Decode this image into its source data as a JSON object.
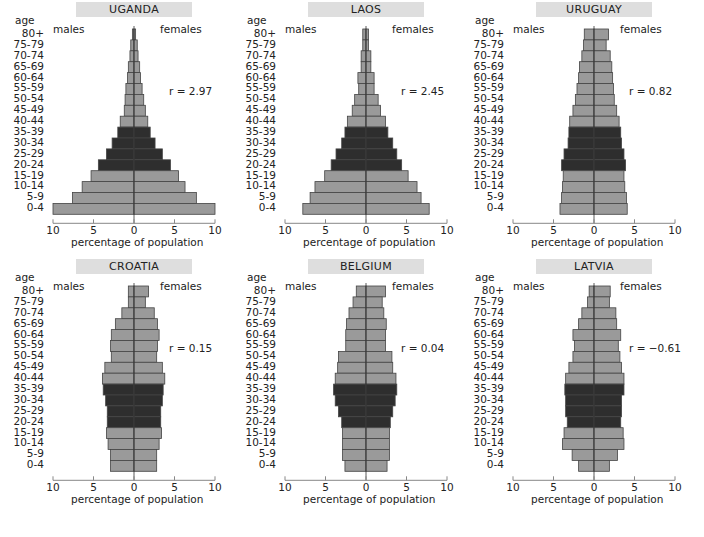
{
  "figure": {
    "age_header": "age",
    "males_label": "males",
    "females_label": "females",
    "xlabel": "percentage of population",
    "x_ticks": [
      "10",
      "5",
      "0",
      "5",
      "10"
    ],
    "age_groups": [
      "80+",
      "75-79",
      "70-74",
      "65-69",
      "60-64",
      "55-59",
      "50-54",
      "45-49",
      "40-44",
      "35-39",
      "30-34",
      "25-29",
      "20-24",
      "15-19",
      "10-14",
      "5-9",
      "0-4"
    ],
    "colors": {
      "bar_light": "#9a9a9a",
      "bar_dark": "#2e2e2e",
      "title_bg": "#dedede",
      "axis": "#888888",
      "bar_edge": "#444444"
    }
  },
  "panels": [
    {
      "country": "UGANDA",
      "r_label": "r = 2.97"
    },
    {
      "country": "LAOS",
      "r_label": "r = 2.45"
    },
    {
      "country": "URUGUAY",
      "r_label": "r = 0.82"
    },
    {
      "country": "CROATIA",
      "r_label": "r = 0.15"
    },
    {
      "country": "BELGIUM",
      "r_label": "r = 0.04"
    },
    {
      "country": "LATVIA",
      "r_label": "r = −0.61"
    }
  ],
  "chart_data": [
    {
      "type": "bar",
      "orientation": "horizontal-pyramid",
      "title": "UGANDA",
      "annotation": "r = 2.97",
      "xlabel": "percentage of population",
      "ylabel": "age",
      "xlim": [
        -10,
        10
      ],
      "x_ticks": [
        10,
        5,
        0,
        5,
        10
      ],
      "categories": [
        "80+",
        "75-79",
        "70-74",
        "65-69",
        "60-64",
        "55-59",
        "50-54",
        "45-49",
        "40-44",
        "35-39",
        "30-34",
        "25-29",
        "20-24",
        "15-19",
        "10-14",
        "5-9",
        "0-4"
      ],
      "highlighted_categories": [
        "35-39",
        "30-34",
        "25-29",
        "20-24"
      ],
      "series": [
        {
          "name": "males",
          "values": [
            0.2,
            0.4,
            0.5,
            0.7,
            0.8,
            1.0,
            1.1,
            1.2,
            1.7,
            2.0,
            2.7,
            3.4,
            4.4,
            5.3,
            6.4,
            7.6,
            10.0
          ]
        },
        {
          "name": "females",
          "values": [
            0.2,
            0.4,
            0.5,
            0.7,
            0.8,
            1.0,
            1.2,
            1.4,
            1.7,
            2.0,
            2.6,
            3.5,
            4.5,
            5.5,
            6.3,
            7.7,
            10.0
          ]
        }
      ]
    },
    {
      "type": "bar",
      "orientation": "horizontal-pyramid",
      "title": "LAOS",
      "annotation": "r = 2.45",
      "xlabel": "percentage of population",
      "ylabel": "age",
      "xlim": [
        -10,
        10
      ],
      "x_ticks": [
        10,
        5,
        0,
        5,
        10
      ],
      "categories": [
        "80+",
        "75-79",
        "70-74",
        "65-69",
        "60-64",
        "55-59",
        "50-54",
        "45-49",
        "40-44",
        "35-39",
        "30-34",
        "25-29",
        "20-24",
        "15-19",
        "10-14",
        "5-9",
        "0-4"
      ],
      "highlighted_categories": [
        "35-39",
        "30-34",
        "25-29",
        "20-24"
      ],
      "series": [
        {
          "name": "males",
          "values": [
            0.4,
            0.4,
            0.6,
            0.6,
            1.0,
            0.9,
            1.4,
            1.7,
            2.3,
            2.6,
            3.0,
            3.7,
            4.3,
            5.1,
            6.3,
            6.9,
            7.8
          ]
        },
        {
          "name": "females",
          "values": [
            0.3,
            0.3,
            0.6,
            0.6,
            1.0,
            1.0,
            1.5,
            1.8,
            2.4,
            2.7,
            3.3,
            3.8,
            4.4,
            5.2,
            6.3,
            6.8,
            7.8
          ]
        }
      ]
    },
    {
      "type": "bar",
      "orientation": "horizontal-pyramid",
      "title": "URUGUAY",
      "annotation": "r = 0.82",
      "xlabel": "percentage of population",
      "ylabel": "age",
      "xlim": [
        -10,
        10
      ],
      "x_ticks": [
        10,
        5,
        0,
        5,
        10
      ],
      "categories": [
        "80+",
        "75-79",
        "70-74",
        "65-69",
        "60-64",
        "55-59",
        "50-54",
        "45-49",
        "40-44",
        "35-39",
        "30-34",
        "25-29",
        "20-24",
        "15-19",
        "10-14",
        "5-9",
        "0-4"
      ],
      "highlighted_categories": [
        "35-39",
        "30-34",
        "25-29",
        "20-24"
      ],
      "series": [
        {
          "name": "males",
          "values": [
            1.2,
            1.3,
            1.5,
            1.8,
            1.9,
            2.1,
            2.3,
            2.6,
            3.0,
            3.1,
            3.2,
            3.7,
            4.0,
            3.8,
            3.9,
            4.0,
            4.2
          ]
        },
        {
          "name": "females",
          "values": [
            1.8,
            1.5,
            2.0,
            2.2,
            2.3,
            2.4,
            2.5,
            2.8,
            3.1,
            3.3,
            3.4,
            3.7,
            3.9,
            3.7,
            3.8,
            4.0,
            4.1
          ]
        }
      ]
    },
    {
      "type": "bar",
      "orientation": "horizontal-pyramid",
      "title": "CROATIA",
      "annotation": "r = 0.15",
      "xlabel": "percentage of population",
      "ylabel": "age",
      "xlim": [
        -10,
        10
      ],
      "x_ticks": [
        10,
        5,
        0,
        5,
        10
      ],
      "categories": [
        "80+",
        "75-79",
        "70-74",
        "65-69",
        "60-64",
        "55-59",
        "50-54",
        "45-49",
        "40-44",
        "35-39",
        "30-34",
        "25-29",
        "20-24",
        "15-19",
        "10-14",
        "5-9",
        "0-4"
      ],
      "highlighted_categories": [
        "35-39",
        "30-34",
        "25-29",
        "20-24"
      ],
      "series": [
        {
          "name": "males",
          "values": [
            0.7,
            0.7,
            1.5,
            2.3,
            2.8,
            2.9,
            2.8,
            3.6,
            3.9,
            3.8,
            3.5,
            3.3,
            3.3,
            3.4,
            3.2,
            2.9,
            2.9
          ]
        },
        {
          "name": "females",
          "values": [
            1.8,
            1.4,
            2.5,
            2.9,
            3.1,
            2.9,
            2.8,
            3.5,
            3.8,
            3.6,
            3.5,
            3.3,
            3.3,
            3.4,
            3.1,
            2.8,
            2.8
          ]
        }
      ]
    },
    {
      "type": "bar",
      "orientation": "horizontal-pyramid",
      "title": "BELGIUM",
      "annotation": "r = 0.04",
      "xlabel": "percentage of population",
      "ylabel": "age",
      "xlim": [
        -10,
        10
      ],
      "x_ticks": [
        10,
        5,
        0,
        5,
        10
      ],
      "categories": [
        "80+",
        "75-79",
        "70-74",
        "65-69",
        "60-64",
        "55-59",
        "50-54",
        "45-49",
        "40-44",
        "35-39",
        "30-34",
        "25-29",
        "20-24",
        "15-19",
        "10-14",
        "5-9",
        "0-4"
      ],
      "highlighted_categories": [
        "35-39",
        "30-34",
        "25-29",
        "20-24"
      ],
      "series": [
        {
          "name": "males",
          "values": [
            1.2,
            1.6,
            2.1,
            2.4,
            2.5,
            2.5,
            3.4,
            3.5,
            3.8,
            4.0,
            3.8,
            3.4,
            3.0,
            2.9,
            2.9,
            2.9,
            2.6
          ]
        },
        {
          "name": "females",
          "values": [
            2.4,
            2.0,
            2.2,
            2.5,
            2.4,
            2.4,
            3.2,
            3.3,
            3.7,
            3.8,
            3.6,
            3.3,
            3.0,
            2.9,
            2.9,
            2.9,
            2.6
          ]
        }
      ]
    },
    {
      "type": "bar",
      "orientation": "horizontal-pyramid",
      "title": "LATVIA",
      "annotation": "r = −0.61",
      "xlabel": "percentage of population",
      "ylabel": "age",
      "xlim": [
        -10,
        10
      ],
      "x_ticks": [
        10,
        5,
        0,
        5,
        10
      ],
      "categories": [
        "80+",
        "75-79",
        "70-74",
        "65-69",
        "60-64",
        "55-59",
        "50-54",
        "45-49",
        "40-44",
        "35-39",
        "30-34",
        "25-29",
        "20-24",
        "15-19",
        "10-14",
        "5-9",
        "0-4"
      ],
      "highlighted_categories": [
        "35-39",
        "30-34",
        "25-29",
        "20-24"
      ],
      "series": [
        {
          "name": "males",
          "values": [
            0.6,
            0.8,
            1.5,
            1.9,
            2.6,
            2.4,
            2.6,
            3.1,
            3.5,
            3.6,
            3.5,
            3.5,
            3.3,
            3.7,
            3.9,
            2.7,
            1.9
          ]
        },
        {
          "name": "females",
          "values": [
            2.0,
            1.9,
            2.7,
            2.8,
            3.3,
            3.0,
            3.2,
            3.4,
            3.7,
            3.7,
            3.4,
            3.4,
            3.3,
            3.6,
            3.7,
            2.9,
            1.9
          ]
        }
      ]
    }
  ]
}
